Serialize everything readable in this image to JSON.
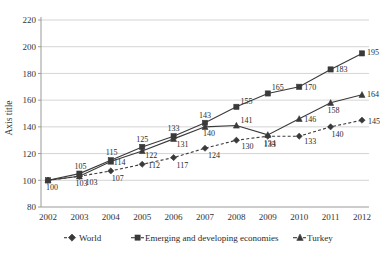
{
  "chart_data": {
    "type": "line",
    "title": "",
    "xlabel": "",
    "ylabel": "Axis title",
    "categories": [
      "2002",
      "2003",
      "2004",
      "2005",
      "2006",
      "2007",
      "2008",
      "2009",
      "2010",
      "2011",
      "2012"
    ],
    "x": [
      2002,
      2003,
      2004,
      2005,
      2006,
      2007,
      2008,
      2009,
      2010,
      2011,
      2012
    ],
    "ylim": [
      80,
      220
    ],
    "yticks": [
      80,
      100,
      120,
      140,
      160,
      180,
      200,
      220
    ],
    "ytick_labels": [
      "80",
      "100",
      "120",
      "140",
      "160",
      "180",
      "200",
      "220"
    ],
    "grid": "horizontal",
    "legend_position": "bottom",
    "data_labels": true,
    "series": [
      {
        "name": "World",
        "marker": "diamond",
        "line_style": "dashed",
        "color": "#3a3a3a",
        "values": [
          100,
          103,
          107,
          112,
          117,
          124,
          130,
          133,
          133,
          140,
          145
        ]
      },
      {
        "name": "Emerging and developing economies",
        "marker": "square",
        "line_style": "solid",
        "color": "#3a3a3a",
        "values": [
          100,
          105,
          115,
          125,
          133,
          143,
          155,
          165,
          170,
          183,
          195
        ]
      },
      {
        "name": "Turkey",
        "marker": "triangle",
        "line_style": "solid",
        "color": "#3a3a3a",
        "values": [
          100,
          103,
          114,
          122,
          131,
          140,
          141,
          134,
          146,
          158,
          164
        ]
      }
    ]
  },
  "axis": {
    "y_title": "Axis title"
  },
  "legend": {
    "items": [
      {
        "label": "World",
        "marker": "diamond"
      },
      {
        "label": "Emerging and developing economies",
        "marker": "square"
      },
      {
        "label": "Turkey",
        "marker": "triangle"
      }
    ]
  }
}
